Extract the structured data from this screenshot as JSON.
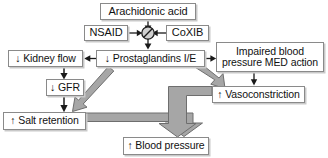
{
  "diagram": {
    "colors": {
      "box_border": "#8a8a8a",
      "box_shadow": "#c9c9c9",
      "thin_arrow": "#1a1a1a",
      "thick_arrow_fill": "#a6a6a6",
      "thick_arrow_stroke": "#6e6e6e",
      "background": "#ffffff",
      "text": "#111111"
    },
    "nodes": [
      {
        "id": "arachidonic",
        "label": "Arachidonic acid"
      },
      {
        "id": "nsaid",
        "label": "NSAID"
      },
      {
        "id": "coxib",
        "label": "CoXIB"
      },
      {
        "id": "kidney_flow",
        "label": "↓ Kidney flow"
      },
      {
        "id": "prostaglandins",
        "label": "↓ Prostaglandins I/E"
      },
      {
        "id": "impaired_line1",
        "label": "Impaired blood"
      },
      {
        "id": "impaired_line2",
        "label": "pressure MED action"
      },
      {
        "id": "gfr",
        "label": "↓ GFR"
      },
      {
        "id": "vasoconstriction",
        "label": "↑ Vasoconstriction"
      },
      {
        "id": "salt_retention",
        "label": "↑ Salt retention"
      },
      {
        "id": "blood_pressure",
        "label": "↑ Blood pressure"
      }
    ],
    "inhibition_symbol": {
      "name": "inhibition-circle",
      "glyph": "crossed-circle"
    },
    "edges": [
      {
        "from": "arachidonic",
        "to": "inhibition-circle",
        "style": "thin",
        "direction": "down"
      },
      {
        "from": "nsaid",
        "to": "inhibition-circle",
        "style": "thin",
        "direction": "right"
      },
      {
        "from": "coxib",
        "to": "inhibition-circle",
        "style": "thin",
        "direction": "left"
      },
      {
        "from": "inhibition-circle",
        "to": "prostaglandins",
        "style": "thin",
        "direction": "down"
      },
      {
        "from": "prostaglandins",
        "to": "kidney_flow",
        "style": "thin",
        "direction": "left"
      },
      {
        "from": "prostaglandins",
        "to": "impaired",
        "style": "thin",
        "direction": "right"
      },
      {
        "from": "kidney_flow",
        "to": "gfr",
        "style": "thin",
        "direction": "down"
      },
      {
        "from": "gfr",
        "to": "salt_retention",
        "style": "thin",
        "direction": "down"
      },
      {
        "from": "impaired",
        "to": "vasoconstriction",
        "style": "thin",
        "direction": "down"
      },
      {
        "from": "prostaglandins",
        "to": "salt_retention",
        "style": "thick",
        "direction": "down-left"
      },
      {
        "from": "prostaglandins",
        "to": "vasoconstriction",
        "style": "thick",
        "direction": "down-right"
      },
      {
        "from": "salt_retention",
        "to": "blood_pressure",
        "style": "thick",
        "direction": "elbow-right-down"
      },
      {
        "from": "vasoconstriction",
        "to": "blood_pressure",
        "style": "thick",
        "direction": "elbow-left-down"
      }
    ]
  }
}
